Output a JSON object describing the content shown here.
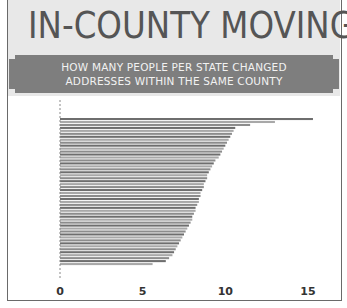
{
  "header": {
    "title": "IN-COUNTY MOVING",
    "subtitle_line1": "HOW MANY PEOPLE PER STATE CHANGED",
    "subtitle_line2": "ADDRESSES WITHIN THE SAME COUNTY"
  },
  "colors": {
    "header_bg": "#e8e8e8",
    "banner": "#7e7e7e",
    "bar_dark": "#6e6e6e",
    "bar_light": "#a8a8a8"
  },
  "chart_data": {
    "type": "bar",
    "orientation": "horizontal",
    "title": "IN-COUNTY MOVING",
    "subtitle": "HOW MANY PEOPLE PER STATE CHANGED ADDRESSES WITHIN THE SAME COUNTY",
    "xlabel": "",
    "ylabel": "",
    "xlim": [
      0,
      16.5
    ],
    "xticks": [
      0,
      5,
      10,
      15
    ],
    "xtick_labels": [
      "0",
      "5",
      "10",
      "15"
    ],
    "grid": false,
    "legend": "none",
    "category_labels_visible": false,
    "values": [
      15.3,
      13.0,
      11.5,
      10.6,
      10.5,
      10.4,
      10.3,
      10.2,
      10.1,
      10.0,
      9.9,
      9.8,
      9.7,
      9.6,
      9.4,
      9.3,
      9.2,
      9.1,
      9.0,
      8.9,
      8.9,
      8.8,
      8.7,
      8.7,
      8.6,
      8.5,
      8.5,
      8.4,
      8.4,
      8.3,
      8.2,
      8.2,
      8.1,
      8.0,
      8.0,
      7.9,
      7.8,
      7.7,
      7.6,
      7.5,
      7.4,
      7.3,
      7.2,
      7.1,
      7.0,
      6.9,
      6.8,
      6.6,
      6.4,
      5.6
    ]
  }
}
